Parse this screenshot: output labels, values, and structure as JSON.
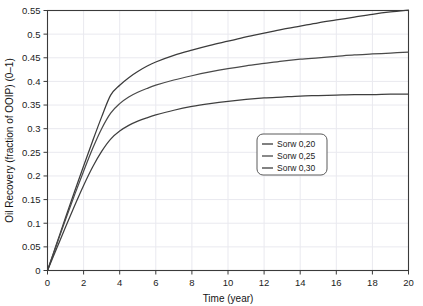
{
  "chart_data": {
    "type": "line",
    "title": "",
    "xlabel": "Time (year)",
    "ylabel": "Oil Recovery (fraction of OOIP) (0–1)",
    "xlim": [
      0,
      20
    ],
    "ylim": [
      0,
      0.55
    ],
    "grid": true,
    "legend_position": "center-right",
    "xticks": [
      "0",
      "2",
      "4",
      "6",
      "8",
      "10",
      "12",
      "14",
      "16",
      "18",
      "20"
    ],
    "xtick_values": [
      0,
      2,
      4,
      6,
      8,
      10,
      12,
      14,
      16,
      18,
      20
    ],
    "yticks": [
      "0",
      "0.05",
      "0.1",
      "0.15",
      "0.2",
      "0.25",
      "0.3",
      "0.35",
      "0.4",
      "0.45",
      "0.5",
      "0.55"
    ],
    "ytick_values": [
      0,
      0.05,
      0.1,
      0.15,
      0.2,
      0.25,
      0.3,
      0.35,
      0.4,
      0.45,
      0.5,
      0.55
    ],
    "x": [
      0,
      0.5,
      1,
      1.5,
      2,
      2.5,
      3,
      3.5,
      4,
      4.5,
      5,
      5.5,
      6,
      7,
      8,
      9,
      10,
      11,
      12,
      13,
      14,
      15,
      16,
      17,
      18,
      19,
      20
    ],
    "series": [
      {
        "name": "Sorw 0,20",
        "color": "#3b3b3b",
        "values": [
          0.0,
          0.056,
          0.112,
          0.167,
          0.221,
          0.274,
          0.325,
          0.371,
          0.392,
          0.408,
          0.421,
          0.432,
          0.441,
          0.455,
          0.466,
          0.476,
          0.485,
          0.494,
          0.502,
          0.51,
          0.517,
          0.524,
          0.53,
          0.536,
          0.542,
          0.547,
          0.551
        ]
      },
      {
        "name": "Sorw 0,25",
        "color": "#4a4a4a",
        "values": [
          0.0,
          0.054,
          0.108,
          0.16,
          0.21,
          0.258,
          0.3,
          0.333,
          0.353,
          0.367,
          0.377,
          0.385,
          0.392,
          0.403,
          0.412,
          0.42,
          0.427,
          0.433,
          0.438,
          0.443,
          0.447,
          0.45,
          0.453,
          0.456,
          0.458,
          0.46,
          0.462
        ]
      },
      {
        "name": "Sorw 0,30",
        "color": "#3f3f3f",
        "values": [
          0.0,
          0.046,
          0.092,
          0.137,
          0.18,
          0.219,
          0.252,
          0.278,
          0.295,
          0.307,
          0.316,
          0.323,
          0.329,
          0.339,
          0.347,
          0.353,
          0.358,
          0.362,
          0.365,
          0.367,
          0.369,
          0.37,
          0.371,
          0.372,
          0.372,
          0.373,
          0.373
        ]
      }
    ],
    "legend_entries": [
      "Sorw 0,20",
      "Sorw 0,25",
      "Sorw 0,30"
    ]
  },
  "colors": {
    "background": "#ffffff",
    "grid": "#e9e9ef",
    "axis": "#3a3a3a",
    "text": "#1c1c1c",
    "legend_border": "#5a5a5a"
  }
}
